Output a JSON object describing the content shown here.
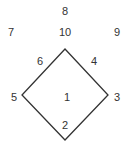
{
  "diagram": {
    "shape": "diamond",
    "stroke_color": "#333333",
    "vertices": {
      "top": [
        65,
        49
      ],
      "right": [
        108,
        95
      ],
      "bottom": [
        65,
        140
      ],
      "left": [
        22,
        95
      ]
    },
    "labels": [
      {
        "id": "8",
        "text": "8",
        "x": 65,
        "y": 11
      },
      {
        "id": "7",
        "text": "7",
        "x": 11,
        "y": 32
      },
      {
        "id": "10",
        "text": "10",
        "x": 65,
        "y": 32
      },
      {
        "id": "9",
        "text": "9",
        "x": 117,
        "y": 32
      },
      {
        "id": "6",
        "text": "6",
        "x": 40,
        "y": 61
      },
      {
        "id": "4",
        "text": "4",
        "x": 94,
        "y": 61
      },
      {
        "id": "5",
        "text": "5",
        "x": 14,
        "y": 97
      },
      {
        "id": "1",
        "text": "1",
        "x": 67,
        "y": 97
      },
      {
        "id": "3",
        "text": "3",
        "x": 117,
        "y": 97
      },
      {
        "id": "2",
        "text": "2",
        "x": 65,
        "y": 125
      }
    ]
  }
}
